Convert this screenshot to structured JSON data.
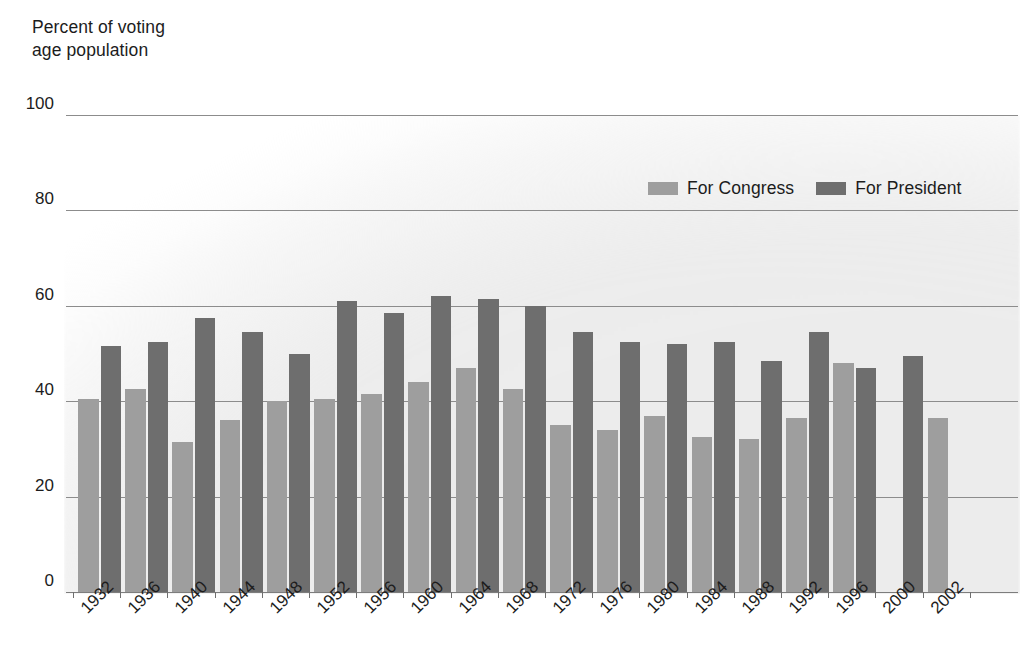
{
  "axis_title": "Percent of voting\nage population",
  "legend": {
    "entries": [
      {
        "label": "For Congress",
        "color": "#9e9e9e",
        "swatch": "congress-swatch"
      },
      {
        "label": "For President",
        "color": "#6e6e6e",
        "swatch": "president-swatch"
      }
    ]
  },
  "colors": {
    "congress": "#9e9e9e",
    "president": "#6e6e6e",
    "gridline": "#8c8c8c",
    "text": "#1c1c1c",
    "plot_background": "#ececec",
    "page_background": "#ffffff"
  },
  "chart_data": {
    "type": "bar",
    "title": "",
    "subtitle": "",
    "xlabel": "",
    "ylabel": "Percent of voting age population",
    "ylim": [
      0,
      100
    ],
    "yticks": [
      0,
      20,
      40,
      60,
      80,
      100
    ],
    "ytick_labels": [
      "0",
      "20",
      "40",
      "60",
      "80",
      "100"
    ],
    "grid": true,
    "legend_position": "top-right",
    "categories": [
      "1932",
      "1936",
      "1940",
      "1944",
      "1948",
      "1952",
      "1956",
      "1960",
      "1964",
      "1968",
      "1972",
      "1976",
      "1980",
      "1984",
      "1988",
      "1992",
      "1996",
      "2000",
      "2002"
    ],
    "series": [
      {
        "name": "For Congress",
        "color": "#9e9e9e",
        "values": [
          40.5,
          42.5,
          31.5,
          36.0,
          40.0,
          40.5,
          41.5,
          44.0,
          47.0,
          42.5,
          35.0,
          34.0,
          37.0,
          32.5,
          32.0,
          36.5,
          48.0,
          null,
          36.5
        ]
      },
      {
        "name": "For President",
        "color": "#6e6e6e",
        "values": [
          51.5,
          52.5,
          57.5,
          54.5,
          50.0,
          61.0,
          58.5,
          62.0,
          61.5,
          60.0,
          54.5,
          52.5,
          52.0,
          52.5,
          48.5,
          54.5,
          47.0,
          49.5,
          null
        ]
      }
    ]
  }
}
